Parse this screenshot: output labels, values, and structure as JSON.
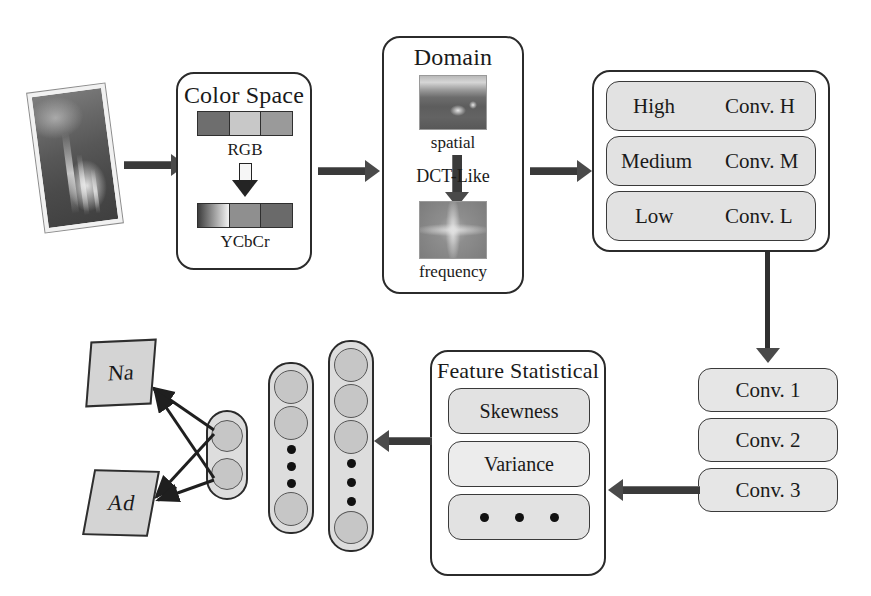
{
  "diagram": {
    "input": {
      "name": "input-image",
      "alt": "tilted photograph"
    },
    "color_space": {
      "title": "Color Space",
      "from_label": "RGB",
      "to_label": "YCbCr",
      "rgb_segments": [
        "#6e6e6e",
        "#c8c8c8",
        "#9a9a9a"
      ],
      "ycbcr_segments": [
        "gradient-dark-to-light",
        "#8f8f8f",
        "#6a6a6a"
      ],
      "transform_icon": "down-arrow-icon"
    },
    "domain": {
      "title": "Domain",
      "spatial_label": "spatial",
      "transform_label": "DCT-Like",
      "frequency_label": "frequency",
      "transform_icon": "down-arrow-icon"
    },
    "frequency_bands": {
      "rows": [
        {
          "band": "High",
          "conv": "Conv. H"
        },
        {
          "band": "Medium",
          "conv": "Conv. M"
        },
        {
          "band": "Low",
          "conv": "Conv. L"
        }
      ]
    },
    "conv_stack": {
      "items": [
        "Conv. 1",
        "Conv. 2",
        "Conv. 3"
      ]
    },
    "feature_statistical": {
      "title": "Feature Statistical",
      "items": [
        "Skewness",
        "Variance"
      ],
      "more_icon": "horizontal-ellipsis-icon"
    },
    "classifier": {
      "layers": [
        {
          "name": "hidden-layer-2",
          "nodes_top": 3,
          "nodes_bottom": 1,
          "ellipsis": 3
        },
        {
          "name": "hidden-layer-1",
          "nodes_top": 2,
          "nodes_bottom": 1,
          "ellipsis": 3
        },
        {
          "name": "output-layer",
          "nodes_top": 2,
          "nodes_bottom": 0,
          "ellipsis": 0
        }
      ],
      "outputs": [
        {
          "label": "Na"
        },
        {
          "label": "Ad"
        }
      ]
    },
    "colors": {
      "stroke": "#2b2b2b",
      "pill_fill": "#e2e2e2",
      "node_fill": "#c6c6c6",
      "layer_fill": "#dddddd",
      "output_fill": "#d4d4d4"
    }
  }
}
